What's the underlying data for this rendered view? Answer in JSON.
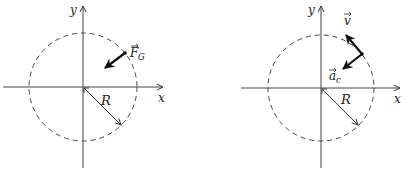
{
  "diagrams": [
    {
      "id": "left",
      "axes": {
        "x_label": "x",
        "y_label": "y"
      },
      "circle_style": "dashed",
      "radius_label": "R",
      "vectors": [
        {
          "name": "gravitational-force",
          "label": "F",
          "subscript": "G",
          "has_arrow_accent": true
        }
      ]
    },
    {
      "id": "right",
      "axes": {
        "x_label": "x",
        "y_label": "y"
      },
      "circle_style": "dashed",
      "radius_label": "R",
      "vectors": [
        {
          "name": "velocity",
          "label": "v",
          "subscript": "",
          "has_arrow_accent": true
        },
        {
          "name": "centripetal-acceleration",
          "label": "a",
          "subscript": "c",
          "has_arrow_accent": true
        }
      ]
    }
  ],
  "colors": {
    "stroke": "#333333",
    "background": "#ffffff"
  }
}
